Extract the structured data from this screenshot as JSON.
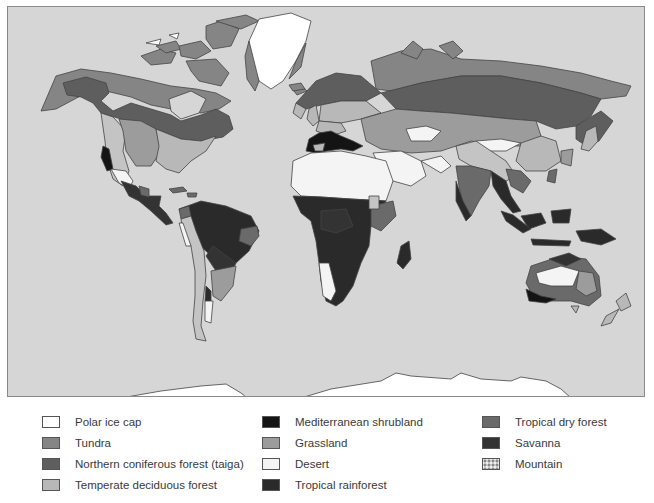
{
  "map": {
    "title": "World biomes",
    "ocean_color": "#d6d6d6",
    "biome_colors": {
      "polar_ice_cap": "#ffffff",
      "tundra": "#858585",
      "taiga": "#5e5e5e",
      "temperate_deciduous_forest": "#b8b8b8",
      "mediterranean_shrubland": "#141414",
      "grassland": "#9c9c9c",
      "desert": "#f4f4f4",
      "tropical_rainforest": "#2a2a2a",
      "tropical_dry_forest": "#6a6a6a",
      "savanna": "#333333",
      "mountain": "#c4c4c4"
    }
  },
  "legend": {
    "items": [
      {
        "label": "Polar ice cap",
        "color": "#ffffff"
      },
      {
        "label": "Tundra",
        "color": "#858585"
      },
      {
        "label": "Northern coniferous forest (taiga)",
        "color": "#5e5e5e"
      },
      {
        "label": "Temperate deciduous forest",
        "color": "#b8b8b8"
      },
      {
        "label": "Mediterranean shrubland",
        "color": "#141414"
      },
      {
        "label": "Grassland",
        "color": "#9c9c9c"
      },
      {
        "label": "Desert",
        "color": "#f4f4f4"
      },
      {
        "label": "Tropical rainforest",
        "color": "#2a2a2a"
      },
      {
        "label": "Tropical dry forest",
        "color": "#6a6a6a"
      },
      {
        "label": "Savanna",
        "color": "#333333"
      },
      {
        "label": "Mountain",
        "color": "#c4c4c4",
        "pattern": "speckled"
      }
    ]
  }
}
